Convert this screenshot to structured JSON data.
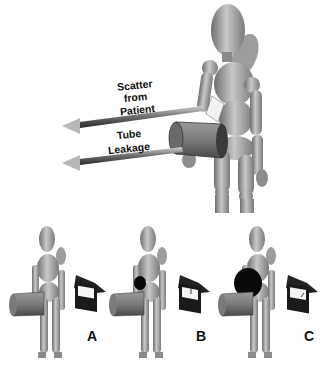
{
  "diagram": {
    "top_panel": {
      "arrows": [
        {
          "label_lines": [
            "Scatter",
            "from",
            "Patient"
          ]
        },
        {
          "label_lines": [
            "Tube",
            "Leakage"
          ]
        }
      ]
    },
    "bottom_panel": {
      "scenarios": [
        {
          "label": "A",
          "shield_size": "none",
          "meter_reading": "low"
        },
        {
          "label": "B",
          "shield_size": "small",
          "meter_reading": "medium"
        },
        {
          "label": "C",
          "shield_size": "large",
          "meter_reading": "high"
        }
      ]
    },
    "colors": {
      "figure": "#9a9a9a",
      "figure_dark": "#5a5a5a",
      "arrow_head": "#b8b8b8",
      "meter_body": "#1a1a1a",
      "shield": "#0a0a0a"
    }
  }
}
